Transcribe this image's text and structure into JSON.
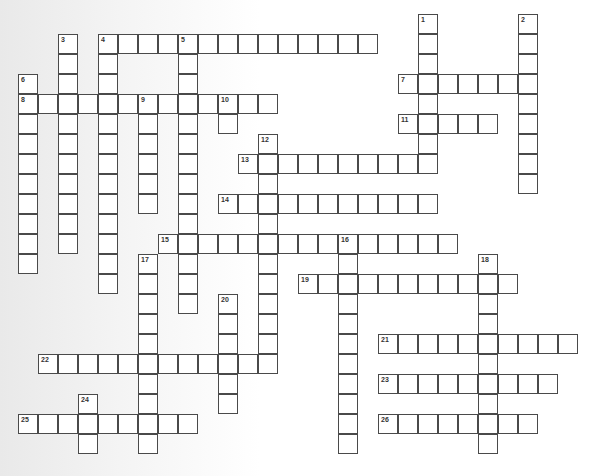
{
  "puzzle": {
    "type": "crossword",
    "origin": {
      "x": 18,
      "y": 14
    },
    "cell_size": 20,
    "entries": [
      {
        "number": "1",
        "direction": "down",
        "col": 20,
        "row": 0,
        "length": 8
      },
      {
        "number": "2",
        "direction": "down",
        "col": 25,
        "row": 0,
        "length": 9
      },
      {
        "number": "3",
        "direction": "down",
        "col": 2,
        "row": 1,
        "length": 11
      },
      {
        "number": "4",
        "direction": "across",
        "col": 4,
        "row": 1,
        "length": 14
      },
      {
        "number": "4",
        "direction": "down",
        "col": 4,
        "row": 1,
        "length": 13
      },
      {
        "number": "5",
        "direction": "down",
        "col": 8,
        "row": 1,
        "length": 14
      },
      {
        "number": "6",
        "direction": "down",
        "col": 0,
        "row": 3,
        "length": 10
      },
      {
        "number": "7",
        "direction": "across",
        "col": 19,
        "row": 3,
        "length": 7
      },
      {
        "number": "8",
        "direction": "across",
        "col": 0,
        "row": 4,
        "length": 13
      },
      {
        "number": "9",
        "direction": "down",
        "col": 6,
        "row": 4,
        "length": 6
      },
      {
        "number": "10",
        "direction": "down",
        "col": 10,
        "row": 4,
        "length": 2
      },
      {
        "number": "11",
        "direction": "across",
        "col": 19,
        "row": 5,
        "length": 5
      },
      {
        "number": "12",
        "direction": "down",
        "col": 12,
        "row": 6,
        "length": 12
      },
      {
        "number": "13",
        "direction": "across",
        "col": 11,
        "row": 7,
        "length": 10
      },
      {
        "number": "14",
        "direction": "across",
        "col": 10,
        "row": 9,
        "length": 11
      },
      {
        "number": "15",
        "direction": "across",
        "col": 7,
        "row": 11,
        "length": 15
      },
      {
        "number": "16",
        "direction": "down",
        "col": 16,
        "row": 11,
        "length": 11
      },
      {
        "number": "17",
        "direction": "down",
        "col": 6,
        "row": 12,
        "length": 10
      },
      {
        "number": "18",
        "direction": "down",
        "col": 23,
        "row": 12,
        "length": 10
      },
      {
        "number": "19",
        "direction": "across",
        "col": 14,
        "row": 13,
        "length": 11
      },
      {
        "number": "20",
        "direction": "down",
        "col": 10,
        "row": 14,
        "length": 6
      },
      {
        "number": "21",
        "direction": "across",
        "col": 18,
        "row": 16,
        "length": 10
      },
      {
        "number": "22",
        "direction": "across",
        "col": 1,
        "row": 17,
        "length": 12
      },
      {
        "number": "23",
        "direction": "across",
        "col": 18,
        "row": 18,
        "length": 9
      },
      {
        "number": "24",
        "direction": "down",
        "col": 3,
        "row": 19,
        "length": 3
      },
      {
        "number": "25",
        "direction": "across",
        "col": 0,
        "row": 20,
        "length": 9
      },
      {
        "number": "26",
        "direction": "across",
        "col": 18,
        "row": 20,
        "length": 8
      }
    ]
  },
  "colors": {
    "border": "#4a4a4a",
    "cell": "#ffffff",
    "number": "#333333"
  }
}
